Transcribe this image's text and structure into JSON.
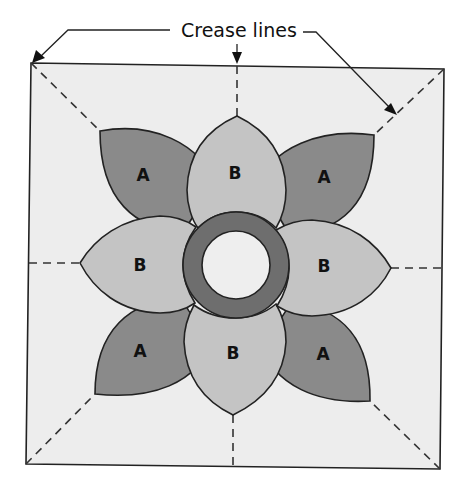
{
  "callout": {
    "label": "Crease lines",
    "arrow_count": 3
  },
  "colors": {
    "background": "#ffffff",
    "block_fill": "#ededed",
    "petal_a_fill": "#8a8a8a",
    "petal_b_fill": "#c4c4c4",
    "ring_fill": "#6e6e6e",
    "center_fill": "#eeeeee",
    "outline": "#222222"
  },
  "petals": {
    "a_top_left": "A",
    "a_top_right": "A",
    "a_bottom_left": "A",
    "a_bottom_right": "A",
    "b_top": "B",
    "b_left": "B",
    "b_right": "B",
    "b_bottom": "B"
  }
}
